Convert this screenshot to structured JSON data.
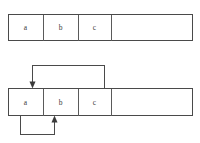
{
  "figure": {
    "title": "",
    "background_color": "#ffffff",
    "line_color": "#4a4a4a",
    "text_color": "#3a3a3a",
    "width": 200,
    "height": 143
  },
  "diagrams": [
    {
      "id": "top-array",
      "name": "array-without-pointers",
      "cells": [
        {
          "label": "a",
          "x": 8,
          "width": 35
        },
        {
          "label": "b",
          "x": 43,
          "width": 35
        },
        {
          "label": "c",
          "x": 78,
          "width": 33
        },
        {
          "label": "",
          "x": 111,
          "width": 82
        }
      ],
      "top": 14,
      "height": 27,
      "arrows": []
    },
    {
      "id": "bottom-array",
      "name": "array-with-pointers",
      "cells": [
        {
          "label": "a",
          "x": 8,
          "width": 35
        },
        {
          "label": "b",
          "x": 43,
          "width": 35
        },
        {
          "label": "c",
          "x": 78,
          "width": 33
        },
        {
          "label": "",
          "x": 111,
          "width": 82
        }
      ],
      "top": 88,
      "height": 28,
      "arrows": [
        {
          "name": "arrow-c-to-a",
          "direction": "down",
          "from": {
            "x": 104,
            "y": 88
          },
          "via": [
            {
              "x": 104,
              "y": 65
            },
            {
              "x": 32,
              "y": 65
            }
          ],
          "to": {
            "x": 32,
            "y": 88
          }
        },
        {
          "name": "arrow-a-to-b",
          "direction": "up",
          "from": {
            "x": 20,
            "y": 116
          },
          "via": [
            {
              "x": 20,
              "y": 135
            },
            {
              "x": 54,
              "y": 135
            }
          ],
          "to": {
            "x": 54,
            "y": 116
          }
        }
      ]
    }
  ],
  "labels": {
    "a": "a",
    "b": "b",
    "c": "c"
  }
}
